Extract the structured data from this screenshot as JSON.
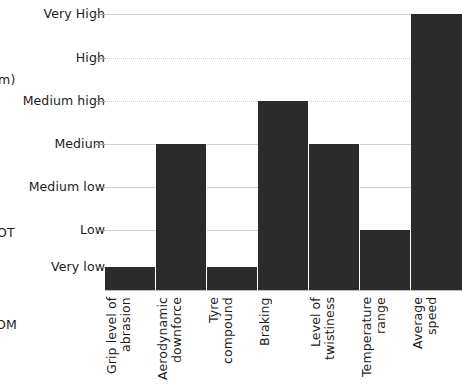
{
  "chart_data": {
    "type": "bar",
    "title": "",
    "subtitle": "",
    "xlabel": "",
    "ylabel": "",
    "grid": true,
    "legend": "none",
    "orientation": "vertical",
    "bar_color": "#2b2b2b",
    "gridline_color": "#d2d2d2",
    "axis_type": "ordinal",
    "y_levels": [
      "Very low",
      "Low",
      "Medium low",
      "Medium",
      "Medium high",
      "High",
      "Very High"
    ],
    "y_tick_labels": [
      "Very High",
      "High",
      "Medium high",
      "Medium",
      "Medium low",
      "Low",
      "Very low"
    ],
    "ylim": [
      0,
      6
    ],
    "categories": [
      "Grip level of abrasion",
      "Aerodynamic downforce",
      "Tyre compound",
      "Braking",
      "Level of twistiness",
      "Temperature range",
      "Average speed"
    ],
    "values": [
      0,
      3,
      0,
      4,
      3,
      1,
      6
    ],
    "value_labels": [
      "Very low",
      "Medium",
      "Very low",
      "Medium high",
      "Medium",
      "Low",
      "Very High"
    ],
    "points": [
      {
        "category": "Grip level of abrasion",
        "value": 0,
        "label": "Very low"
      },
      {
        "category": "Aerodynamic downforce",
        "value": 3,
        "label": "Medium"
      },
      {
        "category": "Tyre compound",
        "value": 0,
        "label": "Very low"
      },
      {
        "category": "Braking",
        "value": 4,
        "label": "Medium high"
      },
      {
        "category": "Level of twistiness",
        "value": 3,
        "label": "Medium"
      },
      {
        "category": "Temperature range",
        "value": 1,
        "label": "Low"
      },
      {
        "category": "Average speed",
        "value": 6,
        "label": "Very High"
      }
    ]
  },
  "clipped_margin_text": {
    "unit_fragment": "m)",
    "fragment_ot": "OT",
    "fragment_om": "OM"
  }
}
